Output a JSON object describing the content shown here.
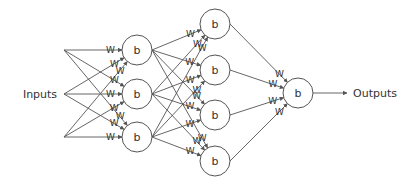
{
  "diagram": {
    "type": "neural-network",
    "colors": {
      "stroke": "#555555",
      "text": "#333333",
      "background": "#ffffff"
    },
    "labels": {
      "inputs": "Inputs",
      "outputs": "Outputs",
      "weight": "W",
      "bias": "b"
    },
    "inputs": {
      "label_pos": [
        40,
        98
      ],
      "fan_x": 64,
      "points_y": [
        50,
        94,
        137
      ]
    },
    "layers": [
      {
        "name": "hidden-1",
        "x": 137,
        "r": 15,
        "nodes_y": [
          50,
          94,
          137
        ]
      },
      {
        "name": "hidden-2",
        "x": 215,
        "r": 15,
        "nodes_y": [
          24,
          70,
          115,
          161
        ]
      },
      {
        "name": "output",
        "x": 298,
        "r": 15,
        "nodes_y": [
          93
        ]
      }
    ],
    "output_arrow": {
      "x1": 313,
      "x2": 347,
      "y": 93
    },
    "outputs_label_pos": [
      353,
      97
    ]
  }
}
